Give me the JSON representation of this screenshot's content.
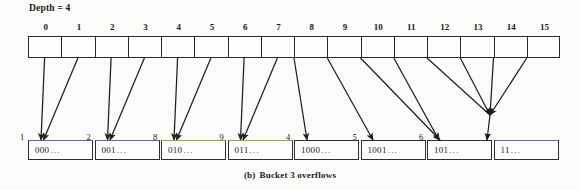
{
  "figure": {
    "depth_label": "Depth = 4",
    "caption_label": "(b)",
    "caption_text": "Bucket 3 overflows"
  },
  "directory": {
    "indices": [
      "0",
      "1",
      "2",
      "3",
      "4",
      "5",
      "6",
      "7",
      "8",
      "9",
      "10",
      "11",
      "12",
      "13",
      "14",
      "15"
    ]
  },
  "buckets": [
    {
      "num": "1",
      "value": "000",
      "dots": "...",
      "edge": "blue"
    },
    {
      "num": "2",
      "value": "001",
      "dots": "...",
      "edge": "blue"
    },
    {
      "num": "8",
      "value": "010",
      "dots": "...",
      "edge": "green"
    },
    {
      "num": "9",
      "value": "011",
      "dots": "...",
      "edge": "green"
    },
    {
      "num": "4",
      "value": "1000",
      "dots": "...",
      "edge": "plain"
    },
    {
      "num": "5",
      "value": "1001",
      "dots": "...",
      "edge": "plain"
    },
    {
      "num": "6",
      "value": "101",
      "dots": "...",
      "edge": "plain"
    },
    {
      "num": "7",
      "value": "11",
      "dots": "...",
      "edge": "blue"
    }
  ],
  "chart_data": {
    "type": "diagram",
    "directory_global_depth": 4,
    "directory_size": 16,
    "directory_entries": [
      {
        "index": 0,
        "points_to_bucket": "1"
      },
      {
        "index": 1,
        "points_to_bucket": "1"
      },
      {
        "index": 2,
        "points_to_bucket": "2"
      },
      {
        "index": 3,
        "points_to_bucket": "2"
      },
      {
        "index": 4,
        "points_to_bucket": "8"
      },
      {
        "index": 5,
        "points_to_bucket": "8"
      },
      {
        "index": 6,
        "points_to_bucket": "9"
      },
      {
        "index": 7,
        "points_to_bucket": "9"
      },
      {
        "index": 8,
        "points_to_bucket": "4"
      },
      {
        "index": 9,
        "points_to_bucket": "5"
      },
      {
        "index": 10,
        "points_to_bucket": "6"
      },
      {
        "index": 11,
        "points_to_bucket": "6"
      },
      {
        "index": 12,
        "points_to_bucket": "7"
      },
      {
        "index": 13,
        "points_to_bucket": "7"
      },
      {
        "index": 14,
        "points_to_bucket": "7"
      },
      {
        "index": 15,
        "points_to_bucket": "7"
      }
    ],
    "bucket_list": [
      {
        "label": "1",
        "prefix": "000",
        "local_depth": 3,
        "pointer_count": 2
      },
      {
        "label": "2",
        "prefix": "001",
        "local_depth": 3,
        "pointer_count": 2
      },
      {
        "label": "8",
        "prefix": "010",
        "local_depth": 3,
        "pointer_count": 2
      },
      {
        "label": "9",
        "prefix": "011",
        "local_depth": 3,
        "pointer_count": 2
      },
      {
        "label": "4",
        "prefix": "1000",
        "local_depth": 4,
        "pointer_count": 1
      },
      {
        "label": "5",
        "prefix": "1001",
        "local_depth": 4,
        "pointer_count": 1
      },
      {
        "label": "6",
        "prefix": "101",
        "local_depth": 3,
        "pointer_count": 2
      },
      {
        "label": "7",
        "prefix": "11",
        "local_depth": 2,
        "pointer_count": 4
      }
    ],
    "accent_colors": {
      "blue": "#5b5bd6",
      "green": "#8ab02f",
      "ink": "#2b2b2b"
    }
  }
}
